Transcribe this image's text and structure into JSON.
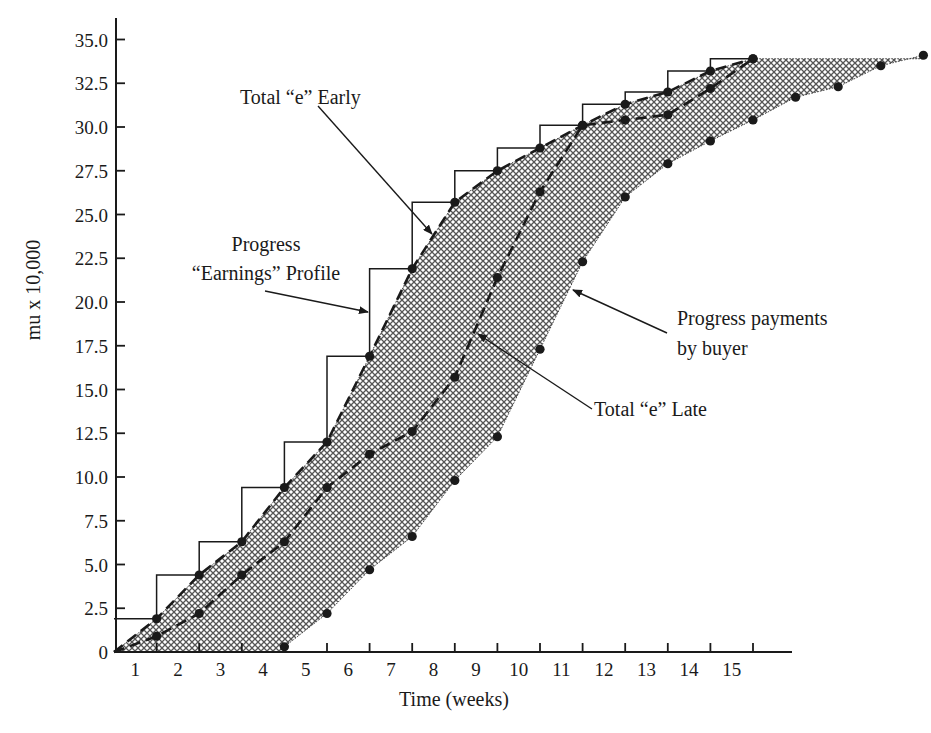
{
  "chart_data": {
    "type": "line",
    "title": "",
    "xlabel": "Time (weeks)",
    "ylabel": "mu x 10,000",
    "ylim": [
      0,
      35
    ],
    "xlim": [
      0,
      19
    ],
    "grid": false,
    "legend": "none (callout annotations)",
    "x_tick_labels": [
      "1",
      "2",
      "3",
      "4",
      "5",
      "6",
      "7",
      "8",
      "9",
      "10",
      "11",
      "12",
      "13",
      "14",
      "15"
    ],
    "y_tick_labels": [
      "0",
      "2.5",
      "5.0",
      "7.5",
      "10.0",
      "12.5",
      "15.0",
      "17.5",
      "20.0",
      "22.5",
      "25.0",
      "27.5",
      "30.0",
      "32.5",
      "35.0"
    ],
    "y_ticks": [
      0,
      2.5,
      5,
      7.5,
      10,
      12.5,
      15,
      17.5,
      20,
      22.5,
      25,
      27.5,
      30,
      32.5,
      35
    ],
    "x": [
      0,
      1,
      2,
      3,
      4,
      5,
      6,
      7,
      8,
      9,
      10,
      11,
      12,
      13,
      14,
      15,
      16,
      17,
      18,
      19
    ],
    "series": [
      {
        "name": "Progress \"Earnings\" Profile",
        "style": "solid step",
        "x": [
          0,
          1,
          2,
          3,
          4,
          5,
          6,
          7,
          8,
          9,
          10,
          11,
          12,
          13,
          14,
          15
        ],
        "values": [
          1.9,
          4.4,
          6.3,
          9.4,
          12.0,
          16.9,
          21.9,
          25.7,
          27.5,
          28.8,
          30.1,
          31.3,
          32.0,
          33.2,
          33.9,
          33.9
        ]
      },
      {
        "name": "Total \"e\" Early",
        "style": "dashed with markers",
        "x": [
          0,
          1,
          2,
          3,
          4,
          5,
          6,
          7,
          8,
          9,
          10,
          11,
          12,
          13,
          14,
          15
        ],
        "values": [
          0,
          1.9,
          4.4,
          6.3,
          9.4,
          12.0,
          16.9,
          21.9,
          25.7,
          27.5,
          28.8,
          30.1,
          31.3,
          32.0,
          33.2,
          33.9
        ]
      },
      {
        "name": "Total \"e\" Late",
        "style": "dashed with markers",
        "x": [
          0,
          1,
          2,
          3,
          4,
          5,
          6,
          7,
          8,
          9,
          10,
          11,
          12,
          13,
          14,
          15
        ],
        "values": [
          0,
          0.9,
          2.2,
          4.4,
          6.3,
          9.4,
          11.3,
          12.6,
          15.7,
          21.4,
          26.3,
          30.1,
          30.4,
          30.7,
          32.2,
          33.9
        ]
      },
      {
        "name": "Progress payments by buyer",
        "style": "markers on lower edge of shaded band",
        "x": [
          4,
          5,
          6,
          7,
          8,
          9,
          10,
          11,
          12,
          13,
          14,
          15,
          16,
          17,
          18,
          19
        ],
        "values": [
          0.3,
          2.2,
          4.7,
          6.6,
          9.8,
          12.3,
          17.3,
          22.3,
          26.0,
          27.9,
          29.2,
          30.4,
          31.7,
          32.3,
          33.5,
          34.1
        ]
      }
    ],
    "shaded_region": "crosshatched band between Total \"e\" Early (upper) and Progress payments by buyer (lower)",
    "annotations": [
      {
        "text": "Total “e” Early",
        "lines": [
          "Total “e” Early"
        ]
      },
      {
        "text": "Progress “Earnings” Profile",
        "lines": [
          "Progress",
          "“Earnings” Profile"
        ]
      },
      {
        "text": "Progress payments by buyer",
        "lines": [
          "Progress payments",
          "by buyer"
        ]
      },
      {
        "text": "Total “e” Late",
        "lines": [
          "Total “e” Late"
        ]
      }
    ],
    "colors": {
      "ink": "#1a1a1a",
      "hatch_fill": "#9a9a9a",
      "background": "#ffffff"
    }
  }
}
